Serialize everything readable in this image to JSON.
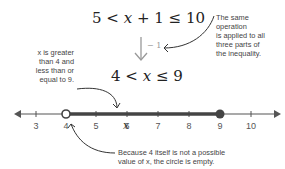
{
  "equations": {
    "top": {
      "left": "5 <",
      "var": "x",
      "right": "+ 1 ≤ 10"
    },
    "bottom": {
      "left": "4 <",
      "var": "x",
      "right": "≤ 9"
    }
  },
  "operation_label": "− 1",
  "notes": {
    "right": [
      "The same",
      "operation",
      "is applied to all",
      "three parts of",
      "the inequality."
    ],
    "left": [
      "x is greater",
      "than 4 and",
      "less than or",
      "equal to 9."
    ],
    "bottom": [
      "Because 4 itself is not a possible",
      "value of x, the circle is empty."
    ]
  },
  "number_line": {
    "ticks": [
      "3",
      "4",
      "5",
      "6",
      "7",
      "8",
      "9",
      "10"
    ],
    "open_point": "4",
    "closed_point": "9",
    "var_label": "x"
  },
  "colors": {
    "line": "#555555",
    "highlight": "#444444",
    "arrow": "#999999"
  }
}
